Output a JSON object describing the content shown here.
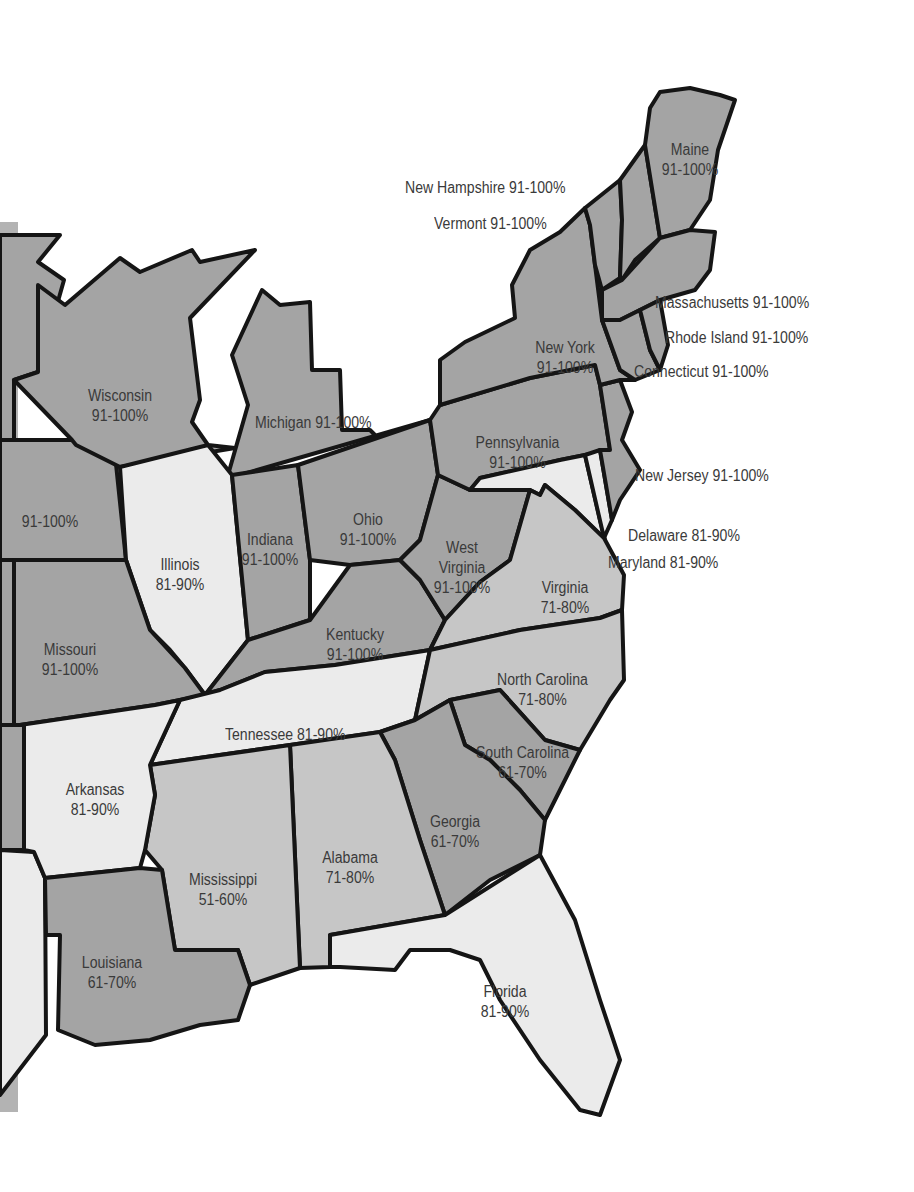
{
  "map": {
    "type": "choropleth",
    "region": "Eastern United States",
    "shade_scale": [
      {
        "range": "91-100%",
        "shade": "dark",
        "color": "#a4a4a4"
      },
      {
        "range": "81-90%",
        "shade": "light",
        "color": "#ebebeb"
      },
      {
        "range": "71-80%",
        "shade": "mid",
        "color": "#c6c6c6"
      },
      {
        "range": "61-70%",
        "shade": "dark",
        "color": "#a4a4a4"
      },
      {
        "range": "51-60%",
        "shade": "mid",
        "color": "#c6c6c6"
      }
    ],
    "states": {
      "maine": {
        "name": "Maine",
        "value": "91-100%"
      },
      "new_hampshire": {
        "name": "New Hampshire",
        "value": "91-100%"
      },
      "vermont": {
        "name": "Vermont",
        "value": "91-100%"
      },
      "massachusetts": {
        "name": "Massachusetts",
        "value": "91-100%"
      },
      "rhode_island": {
        "name": "Rhode Island",
        "value": "91-100%"
      },
      "connecticut": {
        "name": "Connecticut",
        "value": "91-100%"
      },
      "new_york": {
        "name": "New York",
        "value": "91-100%"
      },
      "new_jersey": {
        "name": "New Jersey",
        "value": "91-100%"
      },
      "pennsylvania": {
        "name": "Pennsylvania",
        "value": "91-100%"
      },
      "delaware": {
        "name": "Delaware",
        "value": "81-90%"
      },
      "maryland": {
        "name": "Maryland",
        "value": "81-90%"
      },
      "wisconsin": {
        "name": "Wisconsin",
        "value": "91-100%"
      },
      "michigan": {
        "name": "Michigan",
        "value": "91-100%"
      },
      "illinois": {
        "name": "Illinois",
        "value": "81-90%"
      },
      "indiana": {
        "name": "Indiana",
        "value": "91-100%"
      },
      "ohio": {
        "name": "Ohio",
        "value": "91-100%"
      },
      "west_virginia": {
        "name": "West Virginia",
        "value": "91-100%"
      },
      "virginia": {
        "name": "Virginia",
        "value": "71-80%"
      },
      "kentucky": {
        "name": "Kentucky",
        "value": "91-100%"
      },
      "missouri": {
        "name": "Missouri",
        "value": "91-100%"
      },
      "iowa_partial": {
        "name": "",
        "value": "91-100%"
      },
      "tennessee": {
        "name": "Tennessee",
        "value": "81-90%"
      },
      "north_carolina": {
        "name": "North Carolina",
        "value": "71-80%"
      },
      "south_carolina": {
        "name": "South Carolina",
        "value": "61-70%"
      },
      "arkansas": {
        "name": "Arkansas",
        "value": "81-90%"
      },
      "mississippi": {
        "name": "Mississippi",
        "value": "51-60%"
      },
      "alabama": {
        "name": "Alabama",
        "value": "71-80%"
      },
      "georgia": {
        "name": "Georgia",
        "value": "61-70%"
      },
      "louisiana": {
        "name": "Louisiana",
        "value": "61-70%"
      },
      "florida": {
        "name": "Florida",
        "value": "81-90%"
      }
    }
  }
}
